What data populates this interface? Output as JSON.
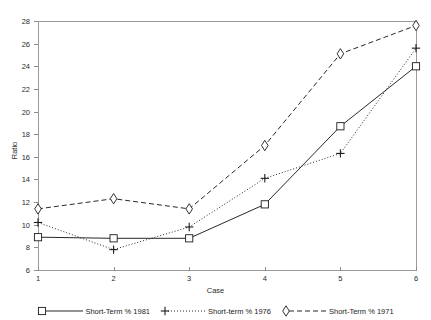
{
  "chart_data": {
    "type": "line",
    "title": "",
    "xlabel": "Case",
    "ylabel": "Ratio",
    "categories": [
      "1",
      "2",
      "3",
      "4",
      "5",
      "6"
    ],
    "x": [
      1,
      2,
      3,
      4,
      5,
      6
    ],
    "xlim": [
      1,
      6
    ],
    "ylim": [
      6,
      28
    ],
    "yticks": [
      6,
      8,
      10,
      12,
      14,
      16,
      18,
      20,
      22,
      24,
      26,
      28
    ],
    "xticks": [
      1,
      2,
      3,
      4,
      5,
      6
    ],
    "grid": false,
    "legend_position": "bottom",
    "series": [
      {
        "name": "Short-Term % 1981",
        "marker": "square",
        "line_style": "solid",
        "color": "#1c1c1c",
        "values": [
          8.9,
          8.8,
          8.8,
          11.8,
          18.7,
          24.0
        ]
      },
      {
        "name": "Short-term % 1976",
        "marker": "plus",
        "line_style": "dotted",
        "color": "#1c1c1c",
        "values": [
          10.2,
          7.8,
          9.8,
          14.1,
          16.3,
          25.6
        ]
      },
      {
        "name": "Short-Term % 1971",
        "marker": "diamond",
        "line_style": "dashed",
        "color": "#1c1c1c",
        "values": [
          11.4,
          12.3,
          11.4,
          17.0,
          25.1,
          27.6
        ]
      }
    ]
  },
  "axes": {
    "ylabel": "Ratio",
    "xlabel": "Case",
    "ytick_labels": [
      "28",
      "26",
      "24",
      "22",
      "20",
      "18",
      "16",
      "14",
      "12",
      "10",
      "8",
      "6"
    ],
    "xtick_labels": [
      "1",
      "2",
      "3",
      "4",
      "5",
      "6"
    ]
  },
  "legend": {
    "entries": [
      {
        "label": "Short-Term % 1981"
      },
      {
        "label": "Short-term % 1976"
      },
      {
        "label": "Short-Term % 1971"
      }
    ]
  },
  "colors": {
    "ink": "#1c1c1c",
    "axis": "#9a9a9a",
    "background": "#ffffff"
  }
}
